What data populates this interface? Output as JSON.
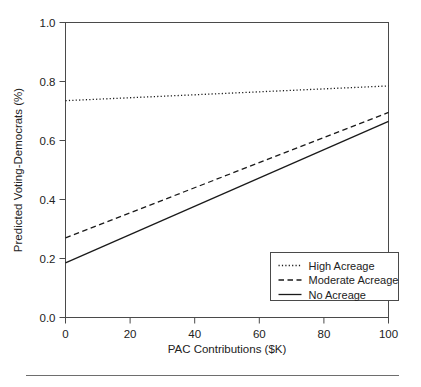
{
  "chart_data": {
    "type": "line",
    "title": "",
    "xlabel": "PAC Contributions ($K)",
    "ylabel": "Predicted Voting-Democrats (%)",
    "xlim": [
      0,
      100
    ],
    "ylim": [
      0.0,
      1.0
    ],
    "xticks": [
      0,
      20,
      40,
      60,
      80,
      100
    ],
    "xtick_labels": [
      "0",
      "20",
      "40",
      "60",
      "80",
      "100"
    ],
    "yticks": [
      0.0,
      0.2,
      0.4,
      0.6,
      0.8,
      1.0
    ],
    "ytick_labels": [
      "0.0",
      "0.2",
      "0.4",
      "0.6",
      "0.8",
      "1.0"
    ],
    "grid": false,
    "legend_position": "bottom-right",
    "x": [
      0,
      100
    ],
    "series": [
      {
        "name": "High Acreage",
        "style": "dotted",
        "color": "#1a1a1a",
        "values": [
          0.735,
          0.785
        ]
      },
      {
        "name": "Moderate Acreage",
        "style": "dashed",
        "color": "#1a1a1a",
        "values": [
          0.27,
          0.695
        ]
      },
      {
        "name": "No Acreage",
        "style": "solid",
        "color": "#1a1a1a",
        "values": [
          0.185,
          0.665
        ]
      }
    ]
  },
  "legend": {
    "entries": [
      {
        "label": "High Acreage",
        "style": "dotted"
      },
      {
        "label": "Moderate Acreage",
        "style": "dashed"
      },
      {
        "label": "No Acreage",
        "style": "solid"
      }
    ]
  },
  "figure": {
    "footer_rule": true,
    "background": "#ffffff",
    "axis_color": "#4a4a4a",
    "line_color": "#1a1a1a"
  }
}
